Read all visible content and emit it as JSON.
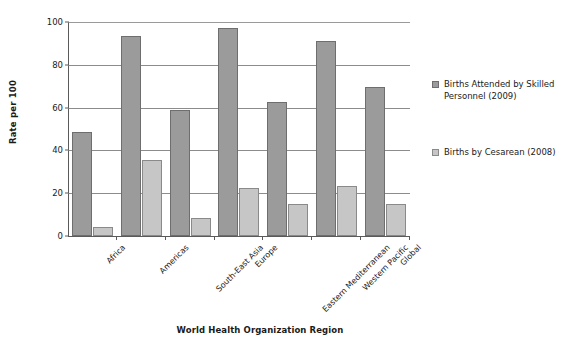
{
  "chart_data": {
    "type": "bar",
    "title": "",
    "xlabel": "World Health Organization Region",
    "ylabel": "Rate per 100",
    "ylim": [
      0,
      100
    ],
    "yticks": [
      0,
      20,
      40,
      60,
      80,
      100
    ],
    "grid": true,
    "legend_position": "right",
    "categories": [
      "Africa",
      "Americas",
      "South-East Asia",
      "Europe",
      "Eastern Mediterranean",
      "Western Pacific",
      "Global"
    ],
    "series": [
      {
        "name": "Births Attended by Skilled Personnel (2009)",
        "color": "#9b9b9b",
        "values": [
          48.5,
          93.5,
          59,
          97,
          62.5,
          91,
          69.5
        ]
      },
      {
        "name": "Births by Cesarean (2008)",
        "color": "#c6c6c6",
        "values": [
          4,
          35.5,
          8.5,
          22.5,
          15,
          23.5,
          15
        ]
      }
    ]
  },
  "legend": {
    "entries": [
      "Births Attended by Skilled Personnel (2009)",
      "Births by Cesarean (2008)"
    ]
  }
}
